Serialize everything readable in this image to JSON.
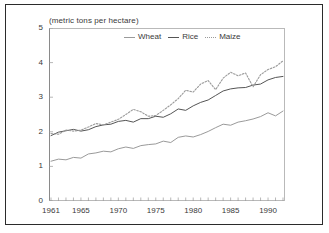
{
  "figure": {
    "unit_title": "(metric tons per hectare)"
  },
  "legend": {
    "position": "top-center",
    "items": [
      {
        "label": "Wheat",
        "style": "solid",
        "color": "#9a9a9a"
      },
      {
        "label": "Rice",
        "style": "solid",
        "color": "#555555"
      },
      {
        "label": "Maize",
        "style": "dotted",
        "color": "#9a9a9a"
      }
    ]
  },
  "axes": {
    "y_ticks": [
      "5",
      "4",
      "3",
      "2",
      "1",
      "0"
    ],
    "x_ticks": [
      "1961",
      "1965",
      "1970",
      "1975",
      "1980",
      "1985",
      "1990"
    ]
  },
  "chart_data": {
    "type": "line",
    "title": "",
    "subtitle": "",
    "xlabel": "",
    "ylabel": "(metric tons per hectare)",
    "ylim": [
      0,
      5
    ],
    "xlim": [
      1961,
      1992
    ],
    "yticks": [
      0,
      1,
      2,
      3,
      4,
      5
    ],
    "xticks": [
      1961,
      1965,
      1970,
      1975,
      1980,
      1985,
      1990
    ],
    "grid": false,
    "legend_position": "top-center",
    "x": [
      1961,
      1962,
      1963,
      1964,
      1965,
      1966,
      1967,
      1968,
      1969,
      1970,
      1971,
      1972,
      1973,
      1974,
      1975,
      1976,
      1977,
      1978,
      1979,
      1980,
      1981,
      1982,
      1983,
      1984,
      1985,
      1986,
      1987,
      1988,
      1989,
      1990,
      1991,
      1992
    ],
    "series": [
      {
        "name": "Wheat",
        "style": "solid",
        "color": "#9a9a9a",
        "values": [
          1.15,
          1.21,
          1.19,
          1.26,
          1.24,
          1.36,
          1.39,
          1.44,
          1.42,
          1.51,
          1.56,
          1.52,
          1.6,
          1.63,
          1.65,
          1.73,
          1.69,
          1.84,
          1.88,
          1.85,
          1.92,
          2.01,
          2.12,
          2.22,
          2.19,
          2.28,
          2.32,
          2.37,
          2.44,
          2.55,
          2.46,
          2.6
        ]
      },
      {
        "name": "Rice",
        "style": "solid",
        "color": "#555555",
        "values": [
          1.89,
          1.99,
          2.03,
          2.07,
          2.02,
          2.06,
          2.15,
          2.2,
          2.22,
          2.3,
          2.33,
          2.28,
          2.38,
          2.38,
          2.45,
          2.42,
          2.52,
          2.66,
          2.62,
          2.75,
          2.85,
          2.92,
          3.05,
          3.18,
          3.24,
          3.27,
          3.28,
          3.35,
          3.38,
          3.5,
          3.57,
          3.6
        ]
      },
      {
        "name": "Maize",
        "style": "dotted",
        "color": "#9a9a9a",
        "values": [
          1.95,
          1.93,
          2.05,
          2.02,
          2.05,
          2.14,
          2.24,
          2.2,
          2.28,
          2.36,
          2.5,
          2.65,
          2.58,
          2.45,
          2.47,
          2.62,
          2.78,
          2.96,
          3.2,
          3.15,
          3.38,
          3.48,
          3.22,
          3.55,
          3.72,
          3.62,
          3.7,
          3.3,
          3.65,
          3.8,
          3.88,
          4.05
        ]
      }
    ]
  }
}
